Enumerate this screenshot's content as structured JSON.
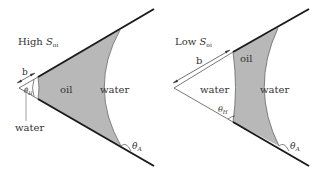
{
  "panels": [
    {
      "title_main": "High ",
      "title_var": "S",
      "title_sub": "oi",
      "labels": {
        "b": "b",
        "theta_H": "θ",
        "theta_H_sub": "H",
        "oil": "oil",
        "water_right": "water",
        "water_corner": "water",
        "theta_A": "θ",
        "theta_A_sub": "A"
      }
    },
    {
      "title_main": "Low ",
      "title_var": "S",
      "title_sub": "oi",
      "labels": {
        "b": "b",
        "theta_H": "θ",
        "theta_H_sub": "H",
        "oil": "oil",
        "water_left": "water",
        "water_right": "water",
        "theta_A": "θ",
        "theta_A_sub": "A"
      }
    }
  ],
  "colors": {
    "oil_fill": "#b8b8b8",
    "line": "#1a1a1a",
    "thin_line": "#555555"
  }
}
